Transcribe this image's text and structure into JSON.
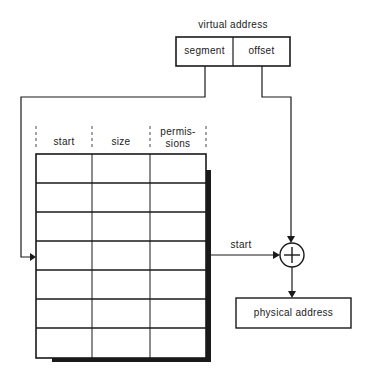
{
  "title": "virtual address",
  "virtual_address": {
    "segment": "segment",
    "offset": "offset"
  },
  "table": {
    "headers": [
      "start",
      "size",
      "permis-",
      "sions"
    ],
    "rows": 7
  },
  "arrow_label": "start",
  "adder_symbol": "+",
  "output": "physical address"
}
